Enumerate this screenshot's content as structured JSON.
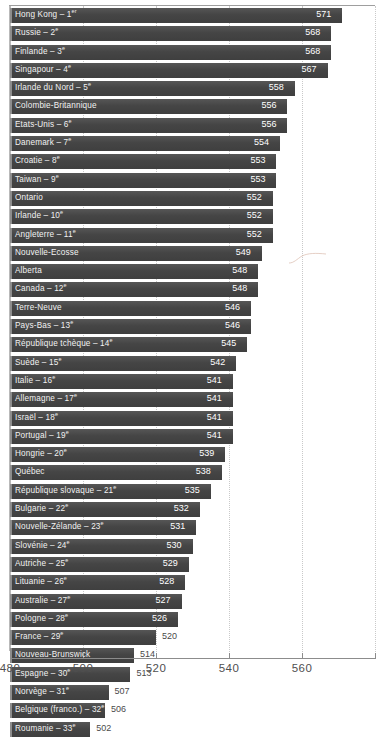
{
  "chart_data": {
    "type": "bar",
    "orientation": "horizontal",
    "title": "",
    "subtitle": "",
    "xlabel": "",
    "ylabel": "",
    "xlim": [
      480,
      580
    ],
    "grid": "vertical-dotted",
    "legend": "none",
    "tick_labels": [
      "480",
      "500",
      "520",
      "540",
      "560"
    ],
    "tick_values": [
      480,
      500,
      520,
      540,
      560
    ],
    "categories": [
      "Hong Kong – 1er",
      "Russie – 2e",
      "Finlande – 3e",
      "Singapour – 4e",
      "Irlande du Nord – 5e",
      "Colombie-Britannique",
      "États-Unis – 6e",
      "Danemark – 7e",
      "Croatie – 8e",
      "Taiwan – 9e",
      "Ontario",
      "Irlande – 10e",
      "Angleterre – 11e",
      "Nouvelle-Écosse",
      "Alberta",
      "Canada – 12e",
      "Terre-Neuve",
      "Pays-Bas – 13e",
      "République tchèque – 14e",
      "Suède – 15e",
      "Italie – 16e",
      "Allemagne – 17e",
      "Israël – 18e",
      "Portugal – 19e",
      "Hongrie – 20e",
      "Québec",
      "République slovaque – 21e",
      "Bulgarie – 22e",
      "Nouvelle-Zélande – 23e",
      "Slovénie – 24e",
      "Autriche – 25e",
      "Lituanie – 26e",
      "Australie – 27e",
      "Pologne – 28e",
      "France – 29e",
      "Nouveau-Brunswick",
      "Espagne – 30e",
      "Norvège – 31e",
      "Belgique (franco.) – 32e",
      "Roumanie – 33e"
    ],
    "values": [
      571,
      568,
      568,
      567,
      558,
      556,
      556,
      554,
      553,
      553,
      552,
      552,
      552,
      549,
      548,
      548,
      546,
      546,
      545,
      542,
      541,
      541,
      541,
      541,
      539,
      538,
      535,
      532,
      531,
      530,
      529,
      528,
      527,
      526,
      520,
      514,
      513,
      507,
      506,
      502
    ]
  },
  "rows": [
    {
      "name": "Hong Kong",
      "rank": "1",
      "rank_suffix": "er",
      "value": 571,
      "value_text": "571"
    },
    {
      "name": "Russie",
      "rank": "2",
      "rank_suffix": "e",
      "value": 568,
      "value_text": "568"
    },
    {
      "name": "Finlande",
      "rank": "3",
      "rank_suffix": "e",
      "value": 568,
      "value_text": "568"
    },
    {
      "name": "Singapour",
      "rank": "4",
      "rank_suffix": "e",
      "value": 567,
      "value_text": "567"
    },
    {
      "name": "Irlande du Nord",
      "rank": "5",
      "rank_suffix": "e",
      "value": 558,
      "value_text": "558"
    },
    {
      "name": "Colombie-Britannique",
      "rank": "",
      "rank_suffix": "",
      "value": 556,
      "value_text": "556"
    },
    {
      "name": "Etats-Unis",
      "rank": "6",
      "rank_suffix": "e",
      "value": 556,
      "value_text": "556"
    },
    {
      "name": "Danemark",
      "rank": "7",
      "rank_suffix": "e",
      "value": 554,
      "value_text": "554"
    },
    {
      "name": "Croatie",
      "rank": "8",
      "rank_suffix": "e",
      "value": 553,
      "value_text": "553"
    },
    {
      "name": "Taiwan",
      "rank": "9",
      "rank_suffix": "e",
      "value": 553,
      "value_text": "553"
    },
    {
      "name": "Ontario",
      "rank": "",
      "rank_suffix": "",
      "value": 552,
      "value_text": "552"
    },
    {
      "name": "Irlande",
      "rank": "10",
      "rank_suffix": "e",
      "value": 552,
      "value_text": "552"
    },
    {
      "name": "Angleterre",
      "rank": "11",
      "rank_suffix": "e",
      "value": 552,
      "value_text": "552"
    },
    {
      "name": "Nouvelle-Ecosse",
      "rank": "",
      "rank_suffix": "",
      "value": 549,
      "value_text": "549"
    },
    {
      "name": "Alberta",
      "rank": "",
      "rank_suffix": "",
      "value": 548,
      "value_text": "548"
    },
    {
      "name": "Canada",
      "rank": "12",
      "rank_suffix": "e",
      "value": 548,
      "value_text": "548"
    },
    {
      "name": "Terre-Neuve",
      "rank": "",
      "rank_suffix": "",
      "value": 546,
      "value_text": "546"
    },
    {
      "name": "Pays-Bas",
      "rank": "13",
      "rank_suffix": "e",
      "value": 546,
      "value_text": "546"
    },
    {
      "name": "République tchèque",
      "rank": "14",
      "rank_suffix": "e",
      "value": 545,
      "value_text": "545"
    },
    {
      "name": "Suède",
      "rank": "15",
      "rank_suffix": "e",
      "value": 542,
      "value_text": "542"
    },
    {
      "name": "Italie",
      "rank": "16",
      "rank_suffix": "e",
      "value": 541,
      "value_text": "541"
    },
    {
      "name": "Allemagne",
      "rank": "17",
      "rank_suffix": "e",
      "value": 541,
      "value_text": "541"
    },
    {
      "name": "Israël",
      "rank": "18",
      "rank_suffix": "e",
      "value": 541,
      "value_text": "541"
    },
    {
      "name": "Portugal",
      "rank": "19",
      "rank_suffix": "e",
      "value": 541,
      "value_text": "541"
    },
    {
      "name": "Hongrie",
      "rank": "20",
      "rank_suffix": "e",
      "value": 539,
      "value_text": "539"
    },
    {
      "name": "Québec",
      "rank": "",
      "rank_suffix": "",
      "value": 538,
      "value_text": "538"
    },
    {
      "name": "République slovaque",
      "rank": "21",
      "rank_suffix": "e",
      "value": 535,
      "value_text": "535"
    },
    {
      "name": "Bulgarie",
      "rank": "22",
      "rank_suffix": "e",
      "value": 532,
      "value_text": "532"
    },
    {
      "name": "Nouvelle-Zélande",
      "rank": "23",
      "rank_suffix": "e",
      "value": 531,
      "value_text": "531"
    },
    {
      "name": "Slovénie",
      "rank": "24",
      "rank_suffix": "e",
      "value": 530,
      "value_text": "530"
    },
    {
      "name": "Autriche",
      "rank": "25",
      "rank_suffix": "e",
      "value": 529,
      "value_text": "529"
    },
    {
      "name": "Lituanie",
      "rank": "26",
      "rank_suffix": "e",
      "value": 528,
      "value_text": "528"
    },
    {
      "name": "Australie",
      "rank": "27",
      "rank_suffix": "e",
      "value": 527,
      "value_text": "527"
    },
    {
      "name": "Pologne",
      "rank": "28",
      "rank_suffix": "e",
      "value": 526,
      "value_text": "526"
    },
    {
      "name": "France",
      "rank": "29",
      "rank_suffix": "e",
      "value": 520,
      "value_text": "520"
    },
    {
      "name": "Nouveau-Brunswick",
      "rank": "",
      "rank_suffix": "",
      "value": 514,
      "value_text": "514"
    },
    {
      "name": "Espagne",
      "rank": "30",
      "rank_suffix": "e",
      "value": 513,
      "value_text": "513"
    },
    {
      "name": "Norvège",
      "rank": "31",
      "rank_suffix": "e",
      "value": 507,
      "value_text": "507"
    },
    {
      "name": "Belgique (franco.)",
      "rank": "32",
      "rank_suffix": "e",
      "value": 506,
      "value_text": "506"
    },
    {
      "name": "Roumanie",
      "rank": "33",
      "rank_suffix": "e",
      "value": 502,
      "value_text": "502"
    }
  ],
  "axis": {
    "ticks": [
      {
        "label": "480",
        "value": 480
      },
      {
        "label": "500",
        "value": 500
      },
      {
        "label": "520",
        "value": 520
      },
      {
        "label": "540",
        "value": 540
      },
      {
        "label": "560",
        "value": 560
      }
    ],
    "min": 480,
    "max": 580
  },
  "colors": {
    "bar": "#454545",
    "bar_highlight": "#8d8d8d",
    "value_inside": "#ffffff",
    "value_outside": "#4a4a4a",
    "gridline": "#c9c9c9",
    "axis": "#8c8c8c",
    "background": "#ffffff"
  },
  "separator_label": "–"
}
